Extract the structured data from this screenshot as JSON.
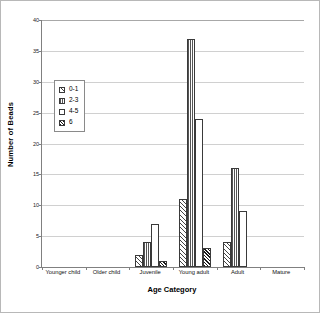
{
  "chart_data": {
    "type": "bar",
    "title": "",
    "xlabel": "Age Category",
    "ylabel": "Number of Beads",
    "ylim": [
      0,
      40
    ],
    "yticks": [
      0,
      5,
      10,
      15,
      20,
      25,
      30,
      35,
      40
    ],
    "grid": true,
    "legend_position": "inside-upper-left",
    "categories": [
      "Younger child",
      "Older child",
      "Juvenile",
      "Young adult",
      "Adult",
      "Mature"
    ],
    "series": [
      {
        "name": "0-1",
        "pattern": "diagonal-hatch",
        "values": [
          0,
          0,
          2,
          11,
          4,
          0
        ]
      },
      {
        "name": "2-3",
        "pattern": "vertical-lines",
        "values": [
          0,
          0,
          4,
          37,
          16,
          0
        ]
      },
      {
        "name": "4-5",
        "pattern": "light-dots",
        "values": [
          0,
          0,
          7,
          24,
          9,
          0
        ]
      },
      {
        "name": "6",
        "pattern": "dense-diagonal-hatch",
        "values": [
          0,
          0,
          1,
          3,
          0,
          0
        ]
      }
    ]
  },
  "legend": {
    "items": [
      {
        "label": "0-1"
      },
      {
        "label": "2-3"
      },
      {
        "label": "4-5"
      },
      {
        "label": "6"
      }
    ]
  }
}
